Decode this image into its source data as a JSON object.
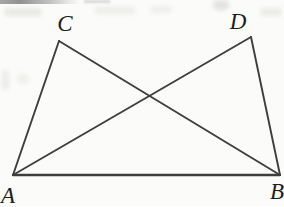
{
  "figure": {
    "type": "geometry-diagram",
    "width": 284,
    "height": 206,
    "background_color": "#fbfbf9",
    "stroke_color": "#3e3e3e",
    "label_color": "#1e1e1e",
    "vertices": {
      "A": {
        "x": 13,
        "y": 175
      },
      "B": {
        "x": 280,
        "y": 175
      },
      "C": {
        "x": 59,
        "y": 41
      },
      "D": {
        "x": 251,
        "y": 37
      }
    },
    "edges": [
      {
        "from": "A",
        "to": "C",
        "width": 1.9
      },
      {
        "from": "C",
        "to": "B",
        "width": 1.9
      },
      {
        "from": "A",
        "to": "D",
        "width": 1.9
      },
      {
        "from": "D",
        "to": "B",
        "width": 1.9
      },
      {
        "from": "A",
        "to": "B",
        "width": 2.3
      }
    ],
    "labels": {
      "A": {
        "text": "A",
        "x": 8,
        "y": 195
      },
      "B": {
        "text": "B",
        "x": 277,
        "y": 191
      },
      "C": {
        "text": "C",
        "x": 65,
        "y": 23
      },
      "D": {
        "text": "D",
        "x": 238,
        "y": 21
      }
    }
  }
}
